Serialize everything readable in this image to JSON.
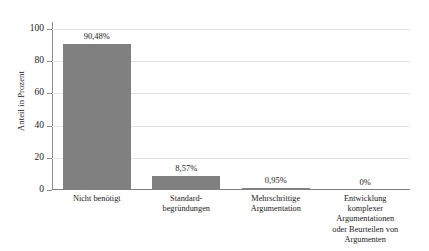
{
  "chart_data": {
    "type": "bar",
    "title": "",
    "subtitle": "",
    "xlabel": "",
    "ylabel": "Anteil in Prozent",
    "ylim": [
      0,
      100
    ],
    "yticks": [
      0,
      20,
      40,
      60,
      80,
      100
    ],
    "ytick_labels": [
      "0",
      "20",
      "40",
      "60",
      "80",
      "100"
    ],
    "grid": true,
    "legend": false,
    "legend_position": "none",
    "bar_color": "#808080",
    "categories": [
      "Nicht benötigt",
      "Standard-\nbegründungen",
      "Mehrschrittige\nArgumentation",
      "Entwicklung\nkomplexer\nArgumentationen\noder Beurteilen von\nArgumenten"
    ],
    "category_lines": [
      [
        "Nicht benötigt"
      ],
      [
        "Standard-",
        "begründungen"
      ],
      [
        "Mehrschrittige",
        "Argumentation"
      ],
      [
        "Entwicklung",
        "komplexer",
        "Argumentationen",
        "oder Beurteilen von",
        "Argumenten"
      ]
    ],
    "values": [
      90.48,
      8.57,
      0.95,
      0
    ],
    "data_labels": [
      "90,48%",
      "8,57%",
      "0,95%",
      "0%"
    ]
  },
  "axis": {
    "y_title": "Anteil in Prozent",
    "y_ticks": [
      "100",
      "80",
      "60",
      "40",
      "20",
      "0"
    ]
  }
}
